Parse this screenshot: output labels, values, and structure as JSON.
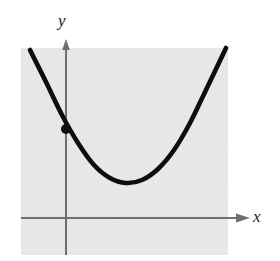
{
  "figure": {
    "type": "math-graph"
  },
  "labels": {
    "x_axis": "x",
    "y_axis": "y"
  },
  "colors": {
    "panel_fill": "#e9e9e9",
    "curve": "#0d0d0d",
    "axis": "#6f6f72",
    "point": "#0d0d0d",
    "page_background": "#ffffff"
  },
  "chart_data": {
    "type": "line",
    "title": "",
    "xlabel": "x",
    "ylabel": "y",
    "grid": false,
    "legend": null,
    "annotations": [
      {
        "name": "y-intercept-point",
        "marker": "filled-circle",
        "px": {
          "x": 66,
          "y": 129
        }
      }
    ],
    "panel_px": {
      "left": 21,
      "top": 48,
      "right": 228,
      "bottom": 255
    },
    "axes_px": {
      "y_axis_x": 66,
      "y_axis_top": 42,
      "y_axis_bottom": 255,
      "x_axis_y": 218,
      "x_axis_left": 21,
      "x_axis_right": 250
    },
    "curve_px": {
      "start": {
        "x": 30,
        "y": 50
      },
      "vertex": {
        "x": 126,
        "y": 183
      },
      "end": {
        "x": 226,
        "y": 48
      }
    },
    "series": [
      {
        "name": "parabola",
        "shape": "upward-parabola",
        "x": [
          30,
          46,
          62,
          78,
          94,
          110,
          126,
          142,
          158,
          174,
          190,
          206,
          226
        ],
        "y": [
          50,
          82,
          115,
          143,
          165,
          178,
          183,
          180,
          169,
          150,
          123,
          90,
          48
        ]
      }
    ]
  }
}
